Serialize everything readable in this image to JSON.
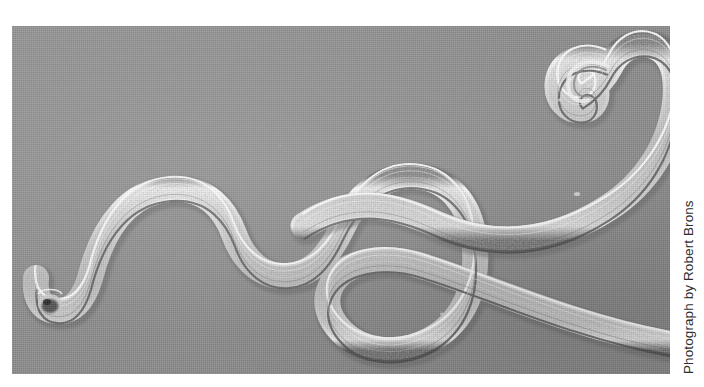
{
  "figure": {
    "kind": "photographic-plate",
    "credit": "Photograph by Robert Brons",
    "plate": {
      "x": 12,
      "y": 26,
      "width": 658,
      "height": 348,
      "background_color": "#8e8e8e",
      "page_background_color": "#ffffff"
    },
    "palette": {
      "field_gray": "#8e8e8e",
      "field_gray_light": "#9a9a9a",
      "field_gray_dark": "#7e7e7e",
      "cuticle_highlight": "#f2f2f2",
      "body_light": "#d8d8d8",
      "body_mid": "#b4b4b4",
      "body_shadow": "#5f5f5f",
      "tail_tip_dark": "#3a3a3a",
      "credit_text": "#2e2e2e"
    },
    "specimens": [
      {
        "id": "worm-left",
        "label": "anterior-to-posterior sinusoidal worm, lower left",
        "description": "Blunt tail tip at lower left with a dark terminal spot, rising into two body waves and curving into a broad U-loop at the bottom right before exiting the right edge of the plate.",
        "tail_tip": {
          "x": 36,
          "y": 277
        },
        "body_width_px": 26
      },
      {
        "id": "worm-right",
        "label": "hooked-head worm, upper right",
        "description": "Enters at the upper right, its anterior end curled into a tight hook; the body descends and crosses to exit the right edge of the plate.",
        "head_hook": {
          "x": 596,
          "y": 44
        },
        "body_width_px": 27
      }
    ]
  }
}
